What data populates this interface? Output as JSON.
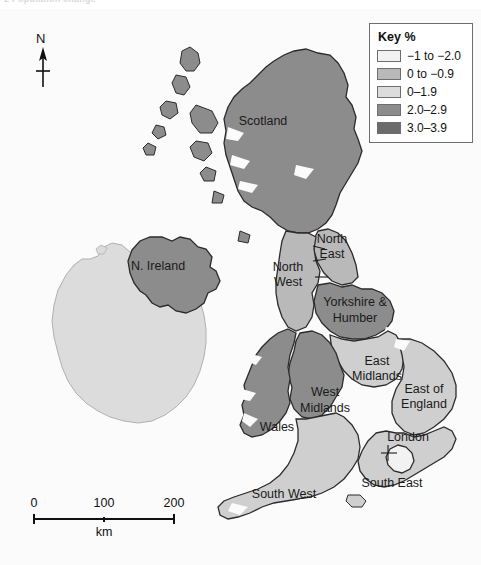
{
  "caption": {
    "ghost_text": "2 Population change"
  },
  "map": {
    "title": "United Kingdom population change by region",
    "north_arrow_label": "N",
    "background_color": "#fbfbfb",
    "sea_color": "#fbfbfb",
    "border_color": "#2b2b2b",
    "regions": [
      {
        "name": "Scotland",
        "label": "Scotland",
        "class_index": 3,
        "color": "#8c8c8c",
        "label_x": 263,
        "label_y": 116
      },
      {
        "name": "N. Ireland",
        "label": "N. Ireland",
        "class_index": 3,
        "color": "#8c8c8c",
        "label_x": 158,
        "label_y": 261
      },
      {
        "name": "North East",
        "label": "North",
        "label2": "East",
        "class_index": 1,
        "color": "#b9b9b9",
        "label_x": 332,
        "label_y": 234
      },
      {
        "name": "North West",
        "label": "North",
        "label2": "West",
        "class_index": 1,
        "color": "#b9b9b9",
        "label_x": 288,
        "label_y": 262
      },
      {
        "name": "Yorkshire & Humber",
        "label": "Yorkshire &",
        "label2": "Humber",
        "class_index": 3,
        "color": "#8c8c8c",
        "label_x": 355,
        "label_y": 293
      },
      {
        "name": "East Midlands",
        "label": "East",
        "label2": "Midlands",
        "class_index": 2,
        "color": "#cfcfcf",
        "label_x": 377,
        "label_y": 356
      },
      {
        "name": "West Midlands",
        "label": "West",
        "label2": "Midlands",
        "class_index": 3,
        "color": "#8c8c8c",
        "label_x": 325,
        "label_y": 387
      },
      {
        "name": "Wales",
        "label": "Wales",
        "class_index": 3,
        "color": "#8c8c8c",
        "label_x": 277,
        "label_y": 422
      },
      {
        "name": "East of England",
        "label": "East of",
        "label2": "England",
        "class_index": 2,
        "color": "#cfcfcf",
        "label_x": 424,
        "label_y": 384
      },
      {
        "name": "London",
        "label": "London",
        "class_index": 0,
        "color": "#f2f2f2",
        "label_x": 408,
        "label_y": 432
      },
      {
        "name": "South East",
        "label": "South East",
        "class_index": 2,
        "color": "#cfcfcf",
        "label_x": 392,
        "label_y": 478
      },
      {
        "name": "South West",
        "label": "South West",
        "class_index": 2,
        "color": "#cfcfcf",
        "label_x": 284,
        "label_y": 489
      }
    ],
    "other_land": [
      {
        "name": "Republic of Ireland",
        "color": "#dcdcdc"
      }
    ]
  },
  "legend": {
    "title": "Key %",
    "items": [
      {
        "label": "−1 to −2.0",
        "color": "#f2f2f2"
      },
      {
        "label": "0 to −0.9",
        "color": "#b9b9b9"
      },
      {
        "label": "0–1.9",
        "color": "#dcdcdc"
      },
      {
        "label": "2.0–2.9",
        "color": "#8c8c8c"
      },
      {
        "label": "3.0–3.9",
        "color": "#6b6b6b"
      }
    ]
  },
  "scale_bar": {
    "ticks": [
      "0",
      "100",
      "200"
    ],
    "unit": "km"
  }
}
